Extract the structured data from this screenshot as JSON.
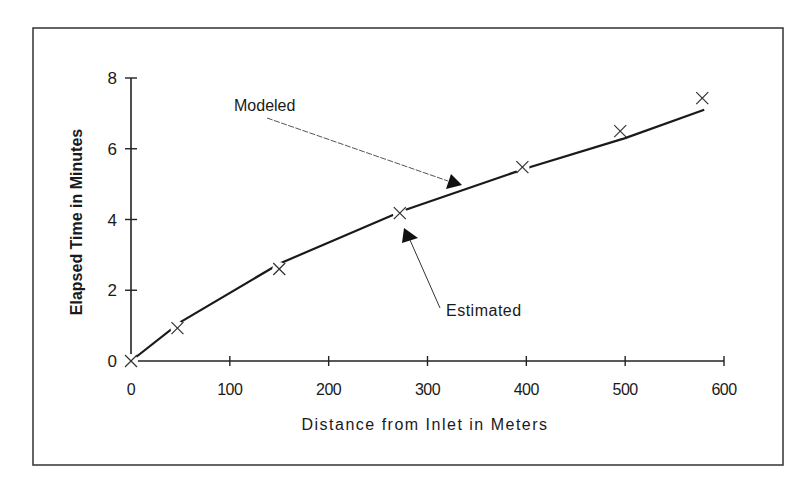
{
  "chart_data": {
    "type": "line",
    "title": "",
    "xlabel": "Distance from Inlet in Meters",
    "ylabel": "Elapsed Time in Minutes",
    "xlim": [
      0,
      600
    ],
    "ylim": [
      0,
      8
    ],
    "x_ticks": [
      0,
      100,
      200,
      300,
      400,
      500,
      600
    ],
    "y_ticks": [
      0,
      2,
      4,
      6,
      8
    ],
    "grid": false,
    "legend": "none",
    "series": [
      {
        "name": "Modeled",
        "style": "solid line",
        "x": [
          0,
          50,
          150,
          275,
          400,
          500,
          580
        ],
        "y": [
          0,
          1.1,
          2.75,
          4.25,
          5.45,
          6.3,
          7.1
        ]
      },
      {
        "name": "Estimated",
        "style": "x markers",
        "x": [
          0,
          47,
          150,
          272,
          396,
          495,
          578
        ],
        "y": [
          0,
          0.93,
          2.6,
          4.18,
          5.48,
          6.5,
          7.43
        ]
      }
    ],
    "annotations": [
      {
        "text": "Modeled",
        "points_to": "modeled line near x=325"
      },
      {
        "text": "Estimated",
        "points_to": "estimated marker near x=275"
      }
    ]
  },
  "labels": {
    "xlabel": "Distance from Inlet in Meters",
    "ylabel": "Elapsed Time in Minutes",
    "annotation_modeled": "Modeled",
    "annotation_estimated": "Estimated"
  }
}
